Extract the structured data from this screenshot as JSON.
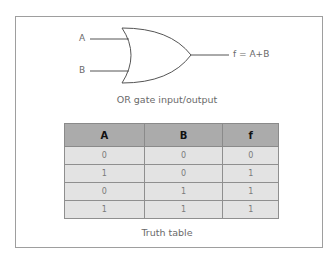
{
  "diagram": {
    "gate_type": "OR",
    "inputs": [
      {
        "label": "A"
      },
      {
        "label": "B"
      }
    ],
    "output": {
      "label": "f = A+B"
    },
    "caption": "OR gate input/output"
  },
  "truth_table": {
    "headers": [
      "A",
      "B",
      "f"
    ],
    "rows": [
      [
        "0",
        "0",
        "0"
      ],
      [
        "1",
        "0",
        "1"
      ],
      [
        "0",
        "1",
        "1"
      ],
      [
        "1",
        "1",
        "1"
      ]
    ],
    "caption": "Truth table"
  },
  "colors": {
    "header_bg": "#ababab",
    "row_bg": "#e3e3e3",
    "line": "#6a6a6a"
  }
}
